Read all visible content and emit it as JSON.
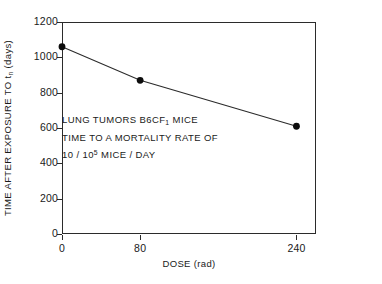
{
  "chart_data": {
    "type": "line",
    "title": "",
    "xlabel": "DOSE (rad)",
    "ylabel": "TIME AFTER EXPOSURE TO tₙ (days)",
    "ylabel_parts": {
      "prefix": "TIME AFTER EXPOSURE TO t",
      "subscript": "n",
      "suffix": " (days)"
    },
    "xlim": [
      0,
      260
    ],
    "ylim": [
      0,
      1200
    ],
    "grid": false,
    "legend": null,
    "marker": "filled-circle",
    "x": [
      0,
      80,
      240
    ],
    "y": [
      1060,
      870,
      610
    ],
    "series": [
      {
        "name": "lung tumors B6CF1 mice",
        "points": [
          {
            "x": 0,
            "y": 1060
          },
          {
            "x": 80,
            "y": 870
          },
          {
            "x": 240,
            "y": 610
          }
        ]
      }
    ],
    "xticks": [
      0,
      80,
      240
    ],
    "xtick_labels": [
      "0",
      "80",
      "240"
    ],
    "yticks": [
      0,
      200,
      400,
      600,
      800,
      1000,
      1200
    ],
    "ytick_labels": [
      "0",
      "200",
      "400",
      "600",
      "800",
      "1000",
      "1200"
    ],
    "annotations": [
      {
        "line_parts": {
          "prefix": "LUNG TUMORS B6CF",
          "subscript": "1",
          "suffix": " MICE"
        }
      },
      {
        "line_parts": {
          "prefix": "TIME TO A MORTALITY RATE OF",
          "subscript": "",
          "suffix": ""
        }
      },
      {
        "line_parts": {
          "prefix": "10 / 10",
          "superscript": "5",
          "suffix": " MICE / DAY"
        }
      }
    ]
  },
  "colors": {
    "axis": "#2b2b2b",
    "line": "#2b2b2b",
    "marker": "#0d0d0d",
    "text": "#1a1a1a",
    "background": "#ffffff"
  }
}
